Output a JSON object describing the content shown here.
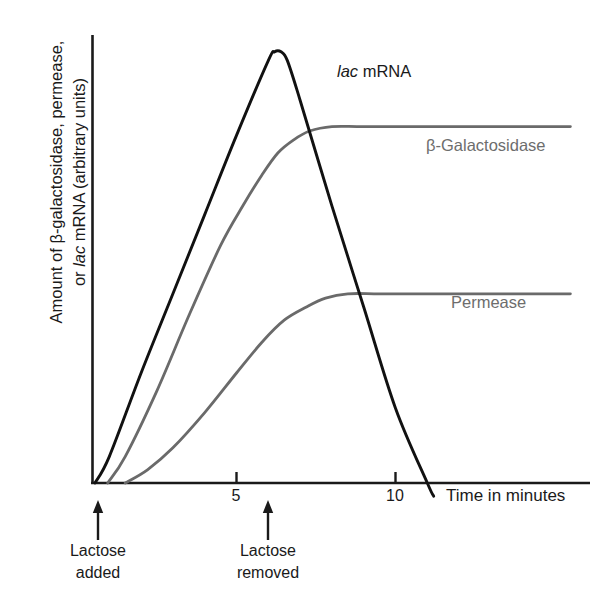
{
  "chart_data": {
    "type": "line",
    "title": "",
    "xlabel": "Time in minutes",
    "ylabel_line1": "Amount of β-galactosidase, permease,",
    "ylabel_line2_prefix": "or ",
    "ylabel_line2_italic": "lac",
    "ylabel_line2_suffix": " mRNA (arbitrary units)",
    "ylabel_full": "Amount of β-galactosidase, permease, or lac mRNA (arbitrary units)",
    "xlim": [
      0,
      15.7
    ],
    "ylim": [
      0,
      100
    ],
    "xticks": [
      5,
      10
    ],
    "xtick_labels": [
      "5",
      "10"
    ],
    "yticks": [],
    "grid": false,
    "legend_position": "inline-curve-labels",
    "series": [
      {
        "name": "lac mRNA",
        "name_italic_part": "lac",
        "name_plain_part": " mRNA",
        "color": "#111111",
        "label_x": 6.6,
        "label_y": 90,
        "x": [
          0.55,
          1.0,
          2.0,
          3.0,
          4.0,
          5.0,
          6.0,
          6.2,
          6.4,
          6.6,
          7.0,
          8.0,
          9.0,
          10.0,
          11.0,
          11.2
        ],
        "y": [
          0,
          6,
          25,
          43,
          61,
          79,
          96,
          98,
          98,
          96,
          87,
          63,
          40,
          17,
          0,
          -3
        ]
      },
      {
        "name": "β-Galactosidase",
        "color": "#6a6a6a",
        "label_x": 10.7,
        "label_y": 74,
        "x": [
          0.95,
          1.5,
          2.5,
          3.5,
          4.5,
          5.2,
          5.8,
          6.3,
          6.8,
          7.3,
          8.0,
          9.0,
          11.0,
          13.0,
          15.5
        ],
        "y": [
          0,
          6,
          21,
          38,
          54,
          63,
          70,
          75,
          78,
          80,
          81,
          81,
          81,
          81,
          81
        ]
      },
      {
        "name": "Permease",
        "color": "#6a6a6a",
        "label_x": 11.5,
        "label_y": 40,
        "x": [
          1.5,
          2.2,
          3.0,
          4.0,
          5.0,
          5.8,
          6.5,
          7.2,
          7.8,
          8.5,
          9.5,
          11.0,
          13.0,
          15.5
        ],
        "y": [
          0,
          3,
          8,
          16,
          25,
          32,
          37,
          40,
          42,
          43,
          43,
          43,
          43,
          43
        ]
      }
    ],
    "events": [
      {
        "id": "lactose-added",
        "x": 0.5,
        "line1": "Lactose",
        "line2": "added"
      },
      {
        "id": "lactose-removed",
        "x": 6.3,
        "line1": "Lactose",
        "line2": "removed"
      }
    ]
  },
  "icons": {
    "up_arrow": "up-arrow-icon"
  }
}
